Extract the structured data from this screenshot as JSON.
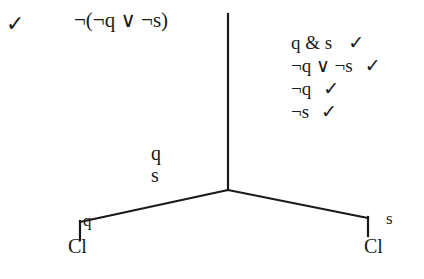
{
  "diagram": {
    "type": "truth-tree-tableau",
    "background_color": "#ffffff",
    "ink_color": "#1a1a1a",
    "root": {
      "check": "✓",
      "formula": "¬(¬q ∨ ¬s)"
    },
    "derived_lines": [
      {
        "formula": "q & s",
        "check": "✓"
      },
      {
        "formula": "¬q ∨ ¬s",
        "check": "✓"
      },
      {
        "formula": "¬q",
        "check": "✓"
      },
      {
        "formula": "¬s",
        "check": "✓"
      }
    ],
    "stem_labels": [
      "q",
      "s"
    ],
    "branches": [
      {
        "side": "left",
        "literal": "q",
        "closure": "Cl"
      },
      {
        "side": "right",
        "literal": "s",
        "closure": "Cl"
      }
    ],
    "geometry": {
      "trunk_x": 228,
      "trunk_top_y": 14,
      "fork_y": 190,
      "left_end_x": 80,
      "left_end_y": 222,
      "right_end_x": 368,
      "right_end_y": 218,
      "tick_length": 16,
      "stroke_width": 2
    }
  }
}
